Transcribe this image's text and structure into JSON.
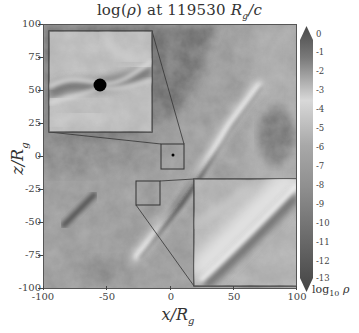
{
  "chart_data": {
    "type": "heatmap",
    "title_prefix": "log(",
    "title_var": "ρ",
    "title_mid": ") at 119530 ",
    "title_unit": "R",
    "title_unit_sub": "g",
    "title_unit_suffix": "/c",
    "xlabel": "x/R_g",
    "ylabel": "z/R_g",
    "xlim": [
      -100,
      100
    ],
    "ylim": [
      -100,
      100
    ],
    "x_ticks": [
      "-100",
      "-50",
      "0",
      "50",
      "100"
    ],
    "y_ticks": [
      "100",
      "75",
      "50",
      "25",
      "0",
      "-25",
      "-50",
      "-75",
      "-100"
    ],
    "colorbar": {
      "label": "log10 ρ",
      "label_main": "log",
      "label_sub": "10",
      "label_var": "ρ",
      "min": -13,
      "max": 0,
      "ticks": [
        "0",
        "-1",
        "-2",
        "-3",
        "-4",
        "-5",
        "-6",
        "-7",
        "-8",
        "-9",
        "-10",
        "-11",
        "-12",
        "-13"
      ],
      "extend": "both",
      "colormap": "greyscale (dark at 0, lightest near -4, darkening to -13)"
    },
    "features": [
      "Dense thin jet/stream running diagonally from lower-left (~-60,-60) to upper-right (~+40,+80)",
      "Black hole (black disk) at origin shown in zoom inset",
      "Low-density dark region in upper-left quadrant",
      "Secondary dense filament near (-75,-45)"
    ],
    "insets": [
      {
        "name": "center-zoom",
        "source_box": {
          "x": [
            -10,
            10
          ],
          "z": [
            -10,
            10
          ]
        },
        "placement": "upper-left",
        "shows": "black hole at center with dense flow band"
      },
      {
        "name": "stream-zoom",
        "source_box": {
          "x": [
            -30,
            -10
          ],
          "z": [
            -40,
            -20
          ]
        },
        "placement": "lower-right",
        "shows": "close-up of diagonal dense stream"
      }
    ],
    "grid": false
  }
}
